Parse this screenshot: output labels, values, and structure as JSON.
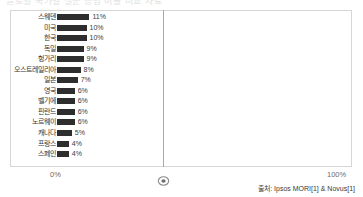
{
  "title_clipped": "글로벌 국가별 설문 응답 비율 비교 자료",
  "chart_data": {
    "type": "bar",
    "orientation": "horizontal",
    "title": "",
    "xlabel": "",
    "ylabel": "",
    "xlim": [
      0,
      100
    ],
    "grid": true,
    "gridlines_at": [
      50
    ],
    "legend": "none",
    "categories": [
      "스웨덴",
      "미국",
      "한국",
      "독일",
      "헝가리",
      "오스트레일리아",
      "일본",
      "영국",
      "벨기에",
      "핀란드",
      "노르웨이",
      "캐나다",
      "프랑스",
      "스페인"
    ],
    "values": [
      11,
      10,
      10,
      9,
      9,
      8,
      7,
      6,
      6,
      6,
      6,
      5,
      4,
      4
    ],
    "value_labels": [
      "11%",
      "10%",
      "10%",
      "9%",
      "9%",
      "8%",
      "7%",
      "6%",
      "6%",
      "6%",
      "6%",
      "5%",
      "4%",
      "4%"
    ],
    "bar_color": "#2e2e2e"
  },
  "axis": {
    "left_tick": "0%",
    "right_tick": "100%",
    "marker_icon": "circle-marker-icon"
  },
  "source": {
    "text": "출처: Ipsos MORI[1] & Novus[1]"
  }
}
